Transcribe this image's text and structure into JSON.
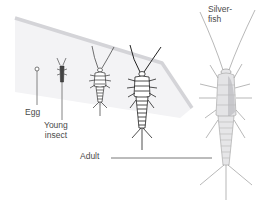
{
  "diagram": {
    "labels": {
      "egg": "Egg",
      "young_line1": "Young",
      "young_line2": "insect",
      "adult": "Adult",
      "silverfish_line1": "Silver-",
      "silverfish_line2": "fish"
    },
    "stages": [
      "egg",
      "young-insect",
      "nymph-small",
      "nymph-large",
      "adult"
    ],
    "colors": {
      "shelf_fill": "#f2f2f4",
      "shelf_edge": "#d6d6da",
      "line": "#555555",
      "insect_outline": "#444444",
      "adult_body": "#e4e4e6",
      "adult_shade": "#c9c9cc",
      "text": "#4a4a4a"
    }
  }
}
